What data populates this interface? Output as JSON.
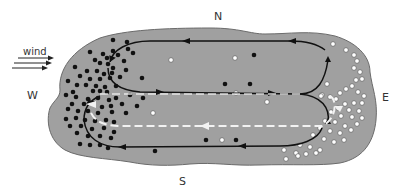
{
  "labels": {
    "north": "N",
    "south": "S",
    "east": "E",
    "west": "W",
    "wind": "wind"
  },
  "colors": {
    "lake_fill": "#a0a0a0",
    "lake_outline": "#6b6b6b",
    "flow_line": "#111111",
    "return_flow": "#f2f2f2",
    "black_particle": "#111111",
    "white_particle": "#ffffff"
  },
  "legend_semantics": {
    "black_dots": "particles accumulated at west (upwind) end",
    "white_dots": "particles accumulated at east (downwind) end",
    "solid_arrows": "surface circulation",
    "dashed_white_arrows": "return flow"
  },
  "black_dots": [
    [
      113,
      40
    ],
    [
      127,
      42
    ],
    [
      90,
      52
    ],
    [
      103,
      54
    ],
    [
      113,
      51
    ],
    [
      128,
      49
    ],
    [
      75,
      67
    ],
    [
      95,
      60
    ],
    [
      107,
      58
    ],
    [
      118,
      55
    ],
    [
      133,
      53
    ],
    [
      100,
      63
    ],
    [
      108,
      64
    ],
    [
      113,
      68
    ],
    [
      124,
      61
    ],
    [
      126,
      70
    ],
    [
      87,
      71
    ],
    [
      97,
      71
    ],
    [
      104,
      74
    ],
    [
      112,
      73
    ],
    [
      80,
      76
    ],
    [
      90,
      79
    ],
    [
      100,
      79
    ],
    [
      110,
      78
    ],
    [
      120,
      77
    ],
    [
      68,
      81
    ],
    [
      77,
      85
    ],
    [
      86,
      85
    ],
    [
      96,
      86
    ],
    [
      105,
      87
    ],
    [
      116,
      86
    ],
    [
      73,
      92
    ],
    [
      93,
      91
    ],
    [
      100,
      91
    ],
    [
      107,
      92
    ],
    [
      66,
      95
    ],
    [
      76,
      97
    ],
    [
      88,
      99
    ],
    [
      98,
      98
    ],
    [
      109,
      100
    ],
    [
      116,
      98
    ],
    [
      130,
      95
    ],
    [
      72,
      104
    ],
    [
      84,
      104
    ],
    [
      93,
      103
    ],
    [
      102,
      107
    ],
    [
      111,
      106
    ],
    [
      122,
      104
    ],
    [
      137,
      106
    ],
    [
      68,
      109
    ],
    [
      78,
      111
    ],
    [
      88,
      111
    ],
    [
      98,
      113
    ],
    [
      112,
      112
    ],
    [
      126,
      113
    ],
    [
      66,
      119
    ],
    [
      76,
      118
    ],
    [
      85,
      120
    ],
    [
      95,
      121
    ],
    [
      106,
      120
    ],
    [
      114,
      122
    ],
    [
      70,
      126
    ],
    [
      81,
      126
    ],
    [
      92,
      129
    ],
    [
      104,
      128
    ],
    [
      114,
      132
    ],
    [
      77,
      133
    ],
    [
      88,
      136
    ],
    [
      100,
      136
    ],
    [
      111,
      138
    ],
    [
      80,
      144
    ],
    [
      90,
      145
    ],
    [
      100,
      145
    ],
    [
      108,
      148
    ],
    [
      254,
      55
    ],
    [
      250,
      84
    ],
    [
      143,
      98
    ],
    [
      142,
      78
    ],
    [
      225,
      84
    ],
    [
      206,
      140
    ],
    [
      236,
      140
    ],
    [
      155,
      151
    ]
  ],
  "white_dots": [
    [
      171,
      60
    ],
    [
      235,
      58
    ],
    [
      236,
      93
    ],
    [
      267,
      102
    ],
    [
      222,
      140
    ],
    [
      153,
      113
    ],
    [
      333,
      44
    ],
    [
      346,
      50
    ],
    [
      354,
      55
    ],
    [
      357,
      61
    ],
    [
      354,
      68
    ],
    [
      360,
      72
    ],
    [
      362,
      79
    ],
    [
      356,
      80
    ],
    [
      352,
      86
    ],
    [
      346,
      89
    ],
    [
      358,
      92
    ],
    [
      364,
      96
    ],
    [
      340,
      93
    ],
    [
      330,
      97
    ],
    [
      322,
      95
    ],
    [
      336,
      99
    ],
    [
      345,
      104
    ],
    [
      354,
      103
    ],
    [
      362,
      103
    ],
    [
      338,
      108
    ],
    [
      349,
      110
    ],
    [
      359,
      111
    ],
    [
      331,
      112
    ],
    [
      341,
      116
    ],
    [
      352,
      117
    ],
    [
      362,
      118
    ],
    [
      325,
      121
    ],
    [
      335,
      122
    ],
    [
      345,
      126
    ],
    [
      357,
      124
    ],
    [
      320,
      128
    ],
    [
      330,
      131
    ],
    [
      340,
      133
    ],
    [
      351,
      130
    ],
    [
      313,
      135
    ],
    [
      324,
      139
    ],
    [
      334,
      142
    ],
    [
      344,
      140
    ],
    [
      300,
      145
    ],
    [
      310,
      147
    ],
    [
      320,
      150
    ],
    [
      284,
      150
    ],
    [
      296,
      153
    ],
    [
      306,
      154
    ],
    [
      316,
      153
    ],
    [
      286,
      159
    ],
    [
      298,
      156
    ],
    [
      321,
      96
    ],
    [
      327,
      84
    ]
  ]
}
